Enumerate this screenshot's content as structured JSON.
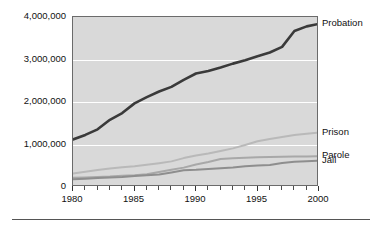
{
  "chart_data": {
    "type": "line",
    "title": "",
    "subtitle": "",
    "xlabel": "",
    "ylabel": "",
    "xlim": [
      1980,
      2000
    ],
    "ylim": [
      0,
      4000000
    ],
    "grid": "horizontal",
    "legend_position": "right-inline",
    "x": [
      1980,
      1981,
      1982,
      1983,
      1984,
      1985,
      1986,
      1987,
      1988,
      1989,
      1990,
      1991,
      1992,
      1993,
      1994,
      1995,
      1996,
      1997,
      1998,
      1999,
      2000
    ],
    "series": [
      {
        "name": "Probation",
        "color": "#3a3a3a",
        "values": [
          1118000,
          1225000,
          1357000,
          1582000,
          1740000,
          1968000,
          2114000,
          2247000,
          2356000,
          2522000,
          2670000,
          2729000,
          2811000,
          2903000,
          2981000,
          3078000,
          3165000,
          3297000,
          3670000,
          3779000,
          3840000
        ]
      },
      {
        "name": "Prison",
        "color": "#b9b9b9",
        "values": [
          320000,
          360000,
          402000,
          437000,
          462000,
          487000,
          523000,
          560000,
          603000,
          680000,
          740000,
          789000,
          847000,
          909000,
          990000,
          1078000,
          1127000,
          1176000,
          1225000,
          1254000,
          1280000
        ]
      },
      {
        "name": "Parole",
        "color": "#a8a8a8",
        "values": [
          220000,
          225000,
          235000,
          246000,
          266000,
          277000,
          300000,
          355000,
          407000,
          456000,
          531000,
          590000,
          658000,
          676000,
          690000,
          700000,
          705000,
          710000,
          715000,
          718000,
          725000
        ]
      },
      {
        "name": "Jail",
        "color": "#8e8e8e",
        "values": [
          184000,
          196000,
          209000,
          224000,
          234000,
          256000,
          274000,
          295000,
          343000,
          395000,
          405000,
          426000,
          444000,
          459000,
          486000,
          507000,
          518000,
          567000,
          592000,
          605000,
          621000
        ]
      }
    ],
    "y_ticks": [
      {
        "value": 4000000,
        "label": "4,000,000"
      },
      {
        "value": 3000000,
        "label": "3,000,000"
      },
      {
        "value": 2000000,
        "label": "2,000,000"
      },
      {
        "value": 1000000,
        "label": "1,000,000"
      },
      {
        "value": 0,
        "label": "0"
      }
    ],
    "x_ticks": [
      {
        "value": 1980,
        "label": "1980"
      },
      {
        "value": 1985,
        "label": "1985"
      },
      {
        "value": 1990,
        "label": "1990"
      },
      {
        "value": 1995,
        "label": "1995"
      },
      {
        "value": 2000,
        "label": "2000"
      }
    ],
    "x_minor_ticks": [
      1981,
      1982,
      1983,
      1984,
      1986,
      1987,
      1988,
      1989,
      1991,
      1992,
      1993,
      1994,
      1996,
      1997,
      1998,
      1999
    ],
    "series_labels": [
      {
        "name": "Probation",
        "y_value": 3840000
      },
      {
        "name": "Prison",
        "y_value": 1280000
      },
      {
        "name": "Parole",
        "y_value": 725000
      },
      {
        "name": "Jail",
        "y_value": 621000
      }
    ],
    "plot_background": "#d9d9d9",
    "gridline_color": "#ffffff",
    "frame_color": "#6b6b6b"
  }
}
